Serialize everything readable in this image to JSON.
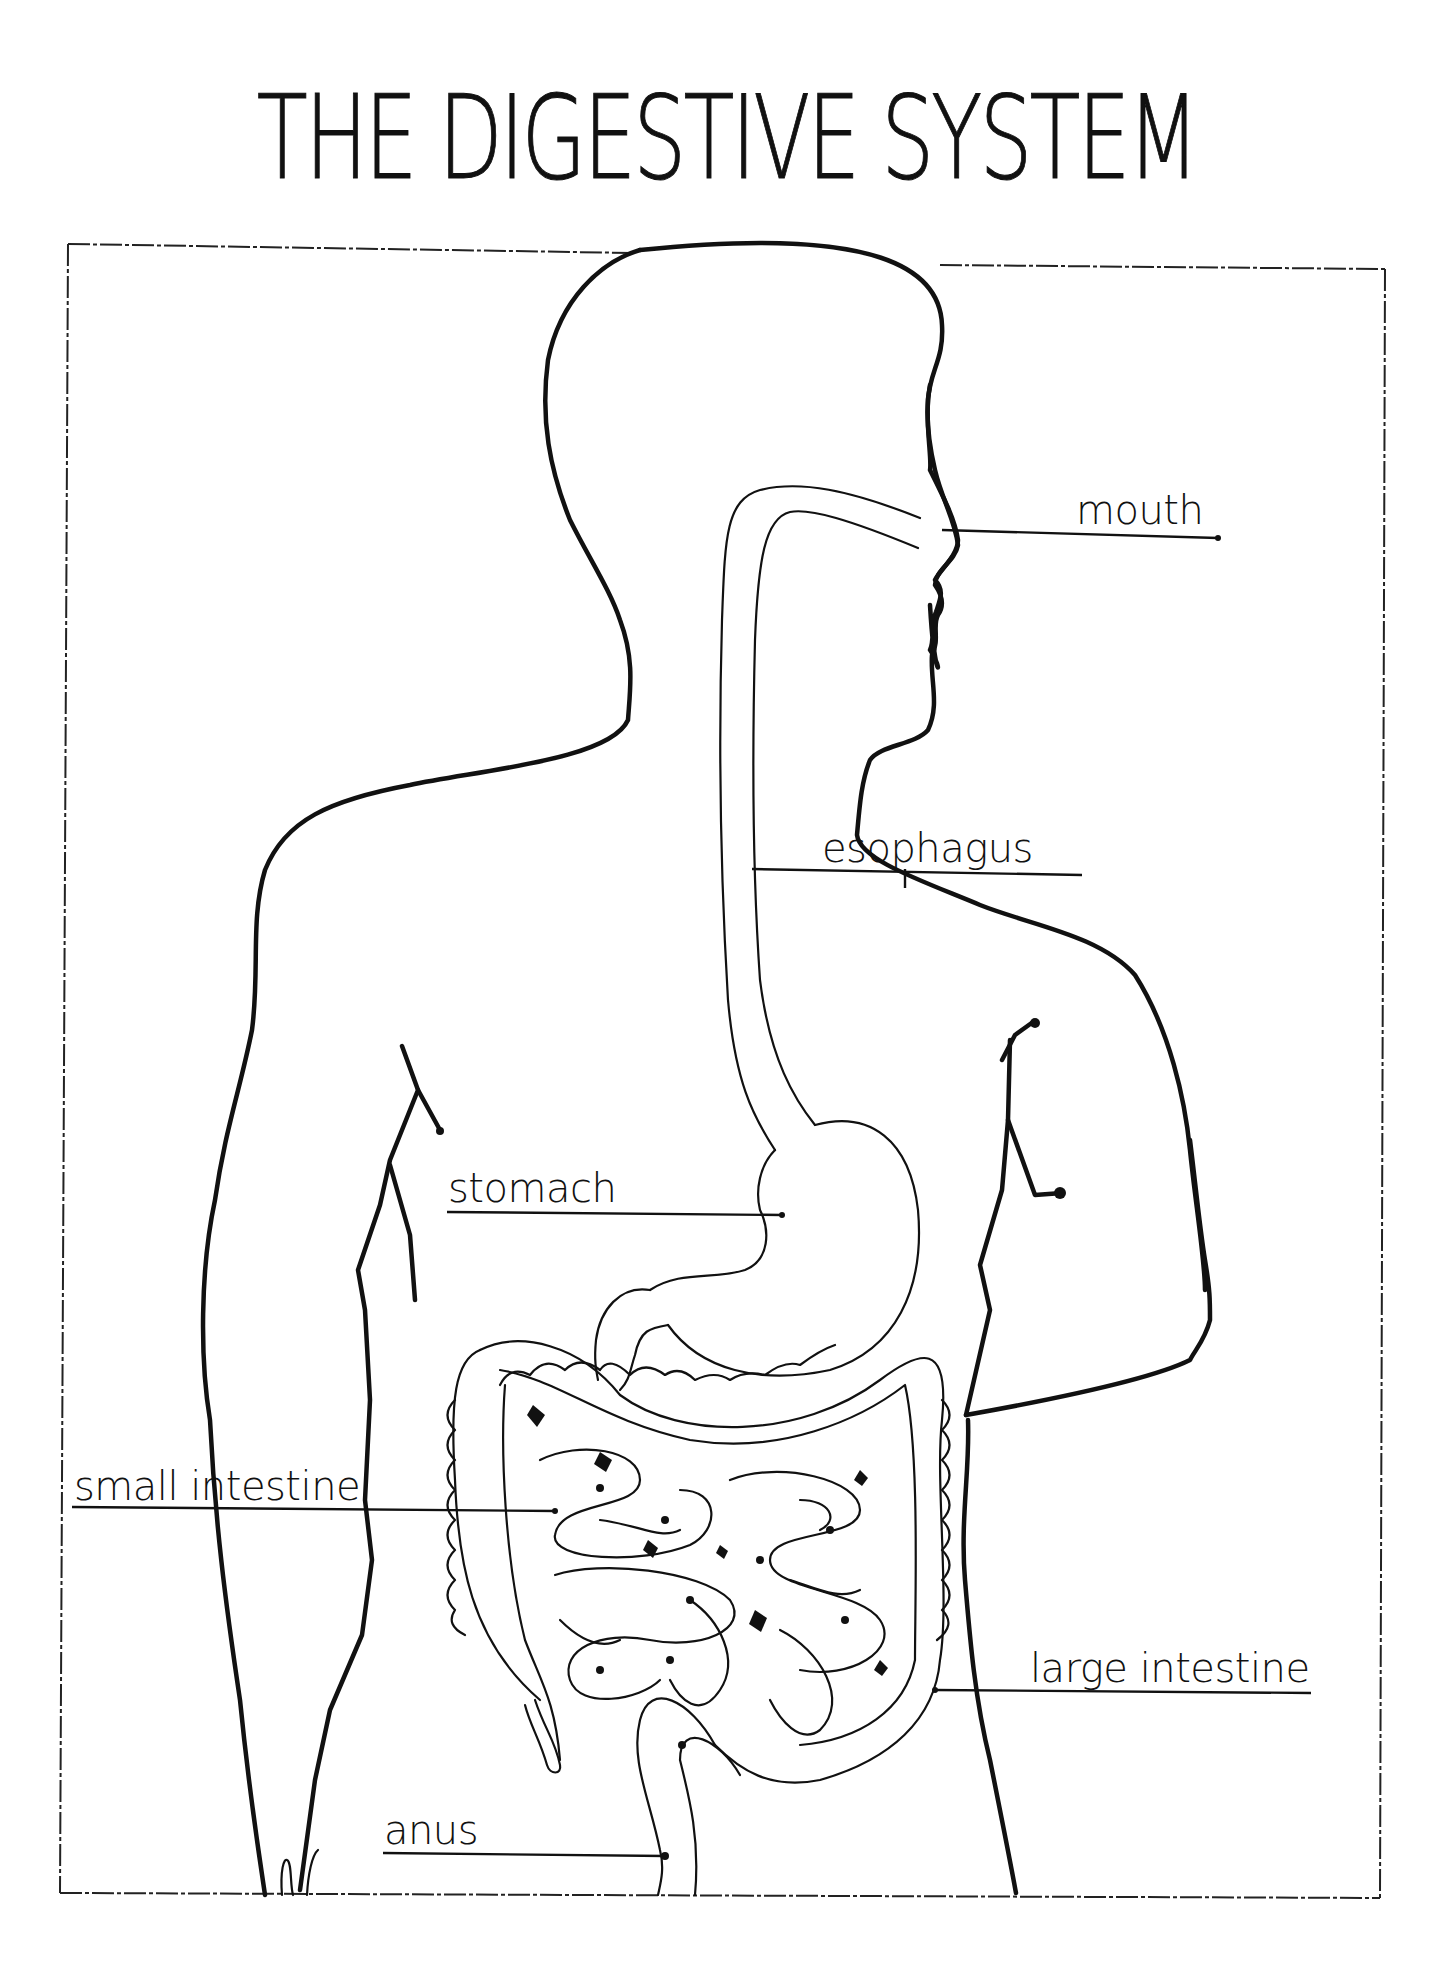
{
  "diagram": {
    "title": "THE DIGESTIVE SYSTEM",
    "labels": [
      {
        "id": "mouth",
        "text": "mouth"
      },
      {
        "id": "esophagus",
        "text": "esophagus"
      },
      {
        "id": "stomach",
        "text": "stomach"
      },
      {
        "id": "small_intestine",
        "text": "small intestine"
      },
      {
        "id": "large_intestine",
        "text": "large intestine"
      },
      {
        "id": "anus",
        "text": "anus"
      }
    ],
    "colors": {
      "ink": "#111111",
      "paper": "#ffffff"
    }
  }
}
